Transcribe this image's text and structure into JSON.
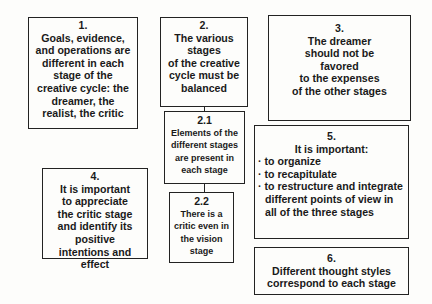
{
  "boxes": {
    "b1": {
      "num": "1.",
      "text": "Goals, evidence,\nand operations are\ndifferent in each\nstage of the\ncreative cycle: the\ndreamer, the\nrealist, the critic"
    },
    "b2": {
      "num": "2.",
      "text": "The various\nstages\nof the creative\ncycle must be\nbalanced"
    },
    "b21": {
      "num": "2.1",
      "text": "Elements of the\ndifferent stages\nare  present in\neach stage"
    },
    "b22": {
      "num": "2.2",
      "text": "There is a\ncritic even in\nthe vision\nstage"
    },
    "b3": {
      "num": "3.",
      "text": "The dreamer\nshould not be\nfavored\nto the expenses\nof the other stages"
    },
    "b4": {
      "num": "4.",
      "text": "It is important\nto appreciate\nthe critic stage\nand identify its\npositive\nintentions and\neffect"
    },
    "b5": {
      "num": "5.",
      "head": "It is important:",
      "bullets": [
        "to organize",
        "to recapitulate",
        "to restructure and integrate\ndifferent points of view in\nall of the three stages"
      ]
    },
    "b6": {
      "num": "6.",
      "text": "Different thought styles\ncorrespond to each stage"
    }
  },
  "bullet_char": "·"
}
